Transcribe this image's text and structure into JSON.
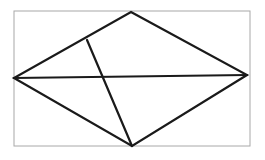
{
  "canvas": {
    "width": 265,
    "height": 160,
    "background_color": "#ffffff"
  },
  "frame": {
    "label": "figure-border",
    "x": 14,
    "y": 11,
    "width": 236,
    "height": 135,
    "stroke_color": "#a8a8a8",
    "stroke_width": 1
  },
  "figure": {
    "name": "quadrilateral-with-diagonals",
    "stroke_color": "#1a1a1a",
    "stroke_width": 2.2,
    "vertices": {
      "top": {
        "label": "top-apex",
        "x": 131,
        "y": 12
      },
      "right": {
        "label": "right-vertex",
        "x": 247,
        "y": 75
      },
      "bottom": {
        "label": "bottom-vertex",
        "x": 132,
        "y": 146
      },
      "left": {
        "label": "left-vertex",
        "x": 14,
        "y": 78
      }
    },
    "outline_points": "131,12 247,75 132,146 14,78",
    "edges": [
      {
        "name": "upper-left-edge",
        "x1": 14,
        "y1": 78,
        "x2": 131,
        "y2": 12
      },
      {
        "name": "upper-right-edge",
        "x1": 131,
        "y1": 12,
        "x2": 247,
        "y2": 75
      },
      {
        "name": "lower-right-edge",
        "x1": 247,
        "y1": 75,
        "x2": 132,
        "y2": 146
      },
      {
        "name": "lower-left-edge",
        "x1": 132,
        "y1": 146,
        "x2": 14,
        "y2": 78
      }
    ],
    "interior_lines": [
      {
        "name": "horizontal-diagonal",
        "from": "left-vertex",
        "to": "right-vertex",
        "x1": 14,
        "y1": 78,
        "x2": 247,
        "y2": 75
      },
      {
        "name": "cevian-segment",
        "from": "point-on-upper-left-edge",
        "to": "bottom-vertex",
        "x1": 87,
        "y1": 40,
        "x2": 132,
        "y2": 146
      }
    ],
    "intersection_points": [
      {
        "name": "diagonal-cevian-crossing",
        "x": 103,
        "y": 76
      },
      {
        "name": "cevian-foot-on-upper-left-edge",
        "x": 87,
        "y": 40
      }
    ]
  }
}
